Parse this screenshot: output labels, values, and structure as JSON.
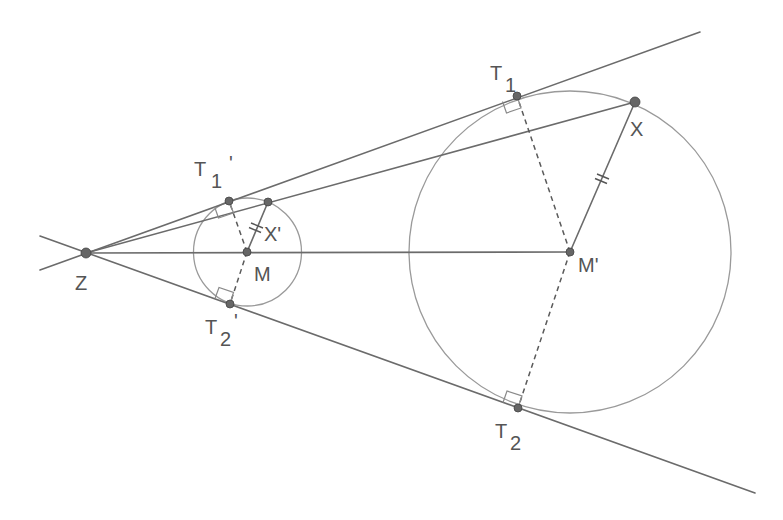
{
  "diagram": {
    "colors": {
      "lines": "#6b6b6b",
      "circles": "#9a9a9a",
      "points": "#666666",
      "labels": "#555555",
      "background": "#ffffff"
    },
    "points": {
      "Z": {
        "label": "Z",
        "x": 86,
        "y": 253
      },
      "M": {
        "label": "M",
        "x": 247,
        "y": 252
      },
      "Mp": {
        "label": "M'",
        "x": 570,
        "y": 252
      },
      "T1p": {
        "label": "T",
        "sub": "1",
        "prime": "'",
        "x": 229,
        "y": 201
      },
      "T2p": {
        "label": "T",
        "sub": "2",
        "prime": "'",
        "x": 230,
        "y": 304
      },
      "T1": {
        "label": "T",
        "sub": "1",
        "prime": "",
        "x": 517,
        "y": 96
      },
      "T2": {
        "label": "T",
        "sub": "2",
        "prime": "",
        "x": 518,
        "y": 408
      },
      "X": {
        "label": "X",
        "x": 635,
        "y": 102
      },
      "Xp": {
        "label": "X'",
        "x": 268,
        "y": 202
      }
    },
    "circles": [
      {
        "name": "small-circle",
        "center": "M",
        "cx": 247.5,
        "cy": 252,
        "r": 54
      },
      {
        "name": "large-circle",
        "center": "M'",
        "cx": 570,
        "cy": 252,
        "r": 161
      }
    ],
    "lines": [
      {
        "name": "upper-tangent",
        "x1": 40,
        "y1": 270,
        "x2": 700,
        "y2": 32
      },
      {
        "name": "lower-tangent",
        "x1": 40,
        "y1": 236,
        "x2": 755,
        "y2": 493
      },
      {
        "name": "secant-ZX",
        "x1": 86,
        "y1": 253,
        "x2": 635,
        "y2": 102
      },
      {
        "name": "center-line-ZM'",
        "x1": 86,
        "y1": 253,
        "x2": 570,
        "y2": 252
      }
    ],
    "segments": [
      {
        "name": "radius-MX'",
        "from": "M",
        "to": "X'",
        "style": "solid",
        "tick_marks": 2
      },
      {
        "name": "radius-M'X",
        "from": "M'",
        "to": "X",
        "style": "solid",
        "tick_marks": 2
      },
      {
        "name": "radius-MT1'",
        "from": "M",
        "to": "T1'",
        "style": "dashed"
      },
      {
        "name": "radius-MT2'",
        "from": "M",
        "to": "T2'",
        "style": "dashed"
      },
      {
        "name": "radius-M'T1",
        "from": "M'",
        "to": "T1",
        "style": "dashed"
      },
      {
        "name": "radius-M'T2",
        "from": "M'",
        "to": "T2",
        "style": "dashed"
      }
    ],
    "right_angle_marks": [
      "T1'",
      "T2'",
      "T1",
      "T2"
    ]
  }
}
